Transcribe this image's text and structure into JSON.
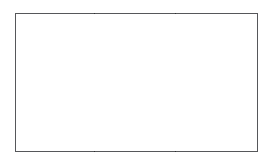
{
  "figure": {
    "type": "three-panel-frame",
    "title": "",
    "caption": "",
    "background_color": "#ffffff",
    "frame": {
      "border_color": "#56575a",
      "border_width_px": 1,
      "fill_color": "#ffffff",
      "x": 15,
      "y": 13,
      "width": 243,
      "height": 139
    },
    "divider": {
      "color": "#2e2f31",
      "width_px": 1,
      "count": 2,
      "x_positions": [
        94,
        175
      ]
    },
    "panels": [
      {
        "name": "left-panel",
        "label": "",
        "text": "",
        "width_px": 78
      },
      {
        "name": "middle-panel",
        "label": "",
        "text": "",
        "width_px": 81
      },
      {
        "name": "right-panel",
        "label": "",
        "text": "",
        "width_px": 82
      }
    ]
  }
}
